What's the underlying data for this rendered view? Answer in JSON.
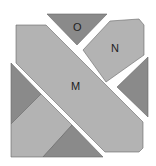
{
  "diagram": {
    "type": "geometric-dissection",
    "colors": {
      "light": "#b3b3b3",
      "dark": "#8a8a8a",
      "stroke": "#555555",
      "background": "#ffffff"
    },
    "labels": {
      "O": "O",
      "N": "N",
      "M": "M"
    },
    "pieces": [
      {
        "id": "O",
        "shade": "dark",
        "points": "47,14 107,14 77,45"
      },
      {
        "id": "N",
        "shade": "light",
        "points": "83,50 110,21 139,19 144,25 144,55 106,82"
      },
      {
        "id": "M",
        "shade": "light",
        "points": "16,25 46,25 143,122 143,148 139,152 105,152 16,63"
      },
      {
        "id": "right-triangle",
        "shade": "dark",
        "points": "117,87 148,57 148,117"
      },
      {
        "id": "left-triangle",
        "shade": "dark",
        "points": "11,63 41,94 11,124"
      },
      {
        "id": "bottom-left-square",
        "shade": "light",
        "points": "11,124 41,94 72,125 43,157 11,157"
      },
      {
        "id": "bottom-triangle",
        "shade": "dark",
        "points": "43,157 72,125 103,157"
      }
    ]
  }
}
